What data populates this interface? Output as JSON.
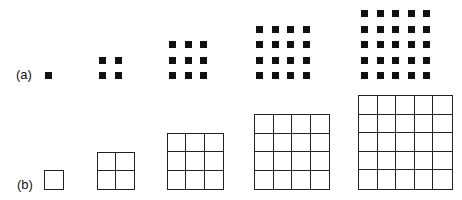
{
  "row_a": {
    "label": "(a)",
    "label_pos": [
      16,
      68
    ],
    "dot_size": 7,
    "dot_spacing": 15.5,
    "dot_color": "#111111",
    "groups": [
      {
        "n": 1,
        "left": 45,
        "bottom": 79
      },
      {
        "n": 2,
        "left": 99,
        "bottom": 79
      },
      {
        "n": 3,
        "left": 169,
        "bottom": 79
      },
      {
        "n": 4,
        "left": 256,
        "bottom": 79
      },
      {
        "n": 5,
        "left": 361,
        "bottom": 79
      }
    ]
  },
  "row_b": {
    "label": "(b)",
    "label_pos": [
      17,
      178
    ],
    "line_color": "#222222",
    "cell_size": 18.7,
    "groups": [
      {
        "n": 1,
        "left": 44,
        "bottom": 190
      },
      {
        "n": 2,
        "left": 97,
        "bottom": 190
      },
      {
        "n": 3,
        "left": 167,
        "bottom": 190
      },
      {
        "n": 4,
        "left": 254,
        "bottom": 190
      },
      {
        "n": 5,
        "left": 358,
        "bottom": 190
      }
    ]
  }
}
